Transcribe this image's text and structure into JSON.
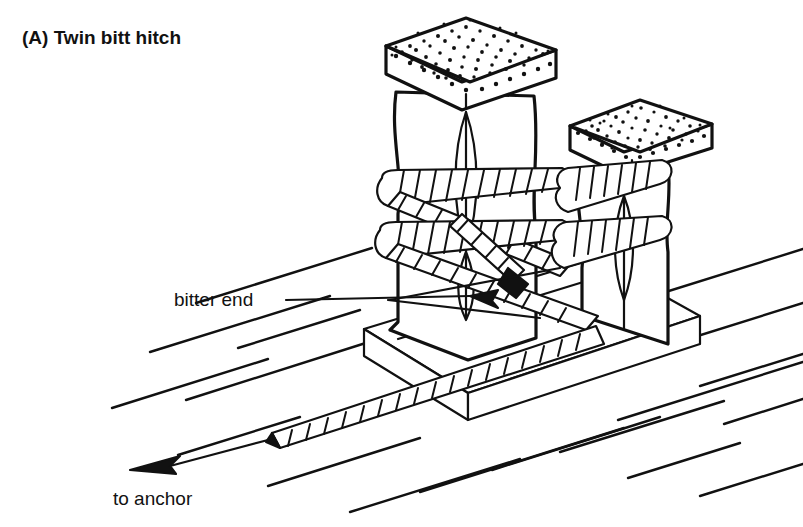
{
  "figure": {
    "panel_label": "(A)",
    "title": "(A) Twin bitt hitch",
    "caption_bitter_end": "bitter end",
    "caption_to_anchor": "to anchor",
    "subject": "twin bitt hitch",
    "style": "black-and-white line drawing",
    "ink_color": "#111111",
    "background_color": "#ffffff"
  },
  "annotations": [
    {
      "name": "bitter-end",
      "label": "bitter end",
      "text_x": 174,
      "text_y": 306,
      "leader_kind": "two-branch arrow",
      "points_to": "free tail end of the rope tucked under the turns on the near bitt"
    },
    {
      "name": "to-anchor",
      "label": "to anchor",
      "text_x": 113,
      "text_y": 505,
      "leader_kind": "single arrow",
      "points_to": "standing part of rope running off the deck toward the anchor"
    }
  ],
  "parts": {
    "left_bitt": {
      "name": "left bitt",
      "role": "near/left vertical post of the twin bitt pair",
      "cap": "stippled square cap with dotted rim band"
    },
    "right_bitt": {
      "name": "right bitt",
      "role": "far/right vertical post of the twin bitt pair",
      "cap": "stippled square cap with dotted rim band"
    },
    "base": {
      "name": "base plinth",
      "role": "common foundation block mounted on the deck"
    },
    "deck": {
      "name": "deck planking",
      "role": "diagonal plank seams of the ship deck"
    },
    "rope": {
      "name": "hitch rope",
      "role": "figure-eight turns taken around both bitts",
      "texture": "hatched lay marks showing rope twist"
    }
  },
  "icons": {
    "arrow_to_anchor": "arrow-left-icon",
    "arrow_bitter_end": "arrow-right-icon"
  }
}
